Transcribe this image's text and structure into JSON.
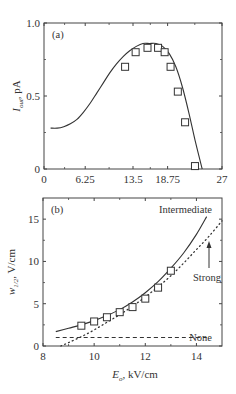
{
  "chart_data": [
    {
      "type": "line",
      "panel": "(a)",
      "title": "",
      "xlabel": "",
      "ylabel": "I_out, pA",
      "ylabel_main": "I",
      "ylabel_sub": "out",
      "ylabel_rest": ", pA",
      "xlim": [
        0,
        27
      ],
      "ylim": [
        0,
        1.0
      ],
      "xticks": [
        0,
        6.25,
        13.5,
        18.75,
        27
      ],
      "xtick_labels": [
        "0",
        "6.25",
        "13.5",
        "18.75",
        "27"
      ],
      "yticks": [
        0,
        0.5,
        1.0
      ],
      "ytick_labels": [
        "0",
        "0.5",
        "1.0"
      ],
      "grid": false,
      "series": [
        {
          "name": "model",
          "style": "solid",
          "x": [
            1.0,
            2.0,
            3.0,
            4.0,
            5.0,
            6.0,
            7.0,
            8.0,
            9.0,
            10.0,
            11.0,
            12.0,
            13.0,
            14.0,
            15.0,
            16.0,
            17.0,
            18.0,
            19.0,
            20.0,
            21.0,
            22.0,
            23.0,
            24.0
          ],
          "y": [
            0.28,
            0.28,
            0.29,
            0.31,
            0.34,
            0.39,
            0.45,
            0.52,
            0.59,
            0.66,
            0.72,
            0.77,
            0.81,
            0.84,
            0.86,
            0.86,
            0.86,
            0.84,
            0.79,
            0.7,
            0.56,
            0.38,
            0.18,
            0.0
          ]
        },
        {
          "name": "measured",
          "style": "open-square",
          "x": [
            12.3,
            13.9,
            15.7,
            17.3,
            18.3,
            19.2,
            20.3,
            21.4,
            22.9
          ],
          "y": [
            0.7,
            0.8,
            0.83,
            0.83,
            0.8,
            0.7,
            0.53,
            0.32,
            0.02
          ]
        }
      ]
    },
    {
      "type": "line",
      "panel": "(b)",
      "title": "",
      "xlabel": "E_o, kV/cm",
      "xlabel_main": "E",
      "xlabel_sub": "o",
      "xlabel_rest": ", kV/cm",
      "ylabel": "w_1/2, V/cm",
      "ylabel_main": "w",
      "ylabel_sub": "1/2",
      "ylabel_rest": ", V/cm",
      "xlim": [
        8,
        15
      ],
      "ylim": [
        0,
        17.5
      ],
      "xticks": [
        8,
        10,
        12,
        14
      ],
      "xtick_labels": [
        "8",
        "10",
        "12",
        "14"
      ],
      "yticks": [
        0,
        5,
        10,
        15
      ],
      "ytick_labels": [
        "0",
        "5",
        "10",
        "15"
      ],
      "grid": false,
      "annotations": [
        "Intermediate",
        "Strong",
        "None"
      ],
      "series": [
        {
          "name": "Intermediate",
          "style": "solid",
          "x": [
            8.5,
            9.0,
            9.5,
            10.0,
            10.5,
            11.0,
            11.5,
            12.0,
            12.5,
            13.0,
            13.5,
            14.0,
            14.4
          ],
          "y": [
            1.7,
            2.1,
            2.5,
            3.0,
            3.6,
            4.3,
            5.2,
            6.3,
            7.6,
            9.2,
            11.0,
            13.2,
            15.3
          ]
        },
        {
          "name": "Strong",
          "style": "dotted",
          "x": [
            8.7,
            9.0,
            9.5,
            10.0,
            10.5,
            11.0,
            11.5,
            12.0,
            12.5,
            13.0,
            13.5,
            14.0,
            14.5,
            15.0
          ],
          "y": [
            0.0,
            0.4,
            1.1,
            1.9,
            2.8,
            3.7,
            4.7,
            5.8,
            7.0,
            8.3,
            9.8,
            11.4,
            13.0,
            14.8
          ]
        },
        {
          "name": "None",
          "style": "dashed",
          "x": [
            8.5,
            14.4
          ],
          "y": [
            1.0,
            1.0
          ]
        },
        {
          "name": "measured",
          "style": "open-square",
          "x": [
            9.5,
            10.0,
            10.5,
            11.0,
            11.5,
            12.0,
            12.5,
            13.0
          ],
          "y": [
            2.4,
            2.9,
            3.4,
            4.0,
            4.6,
            5.6,
            6.9,
            8.9
          ]
        }
      ]
    }
  ]
}
